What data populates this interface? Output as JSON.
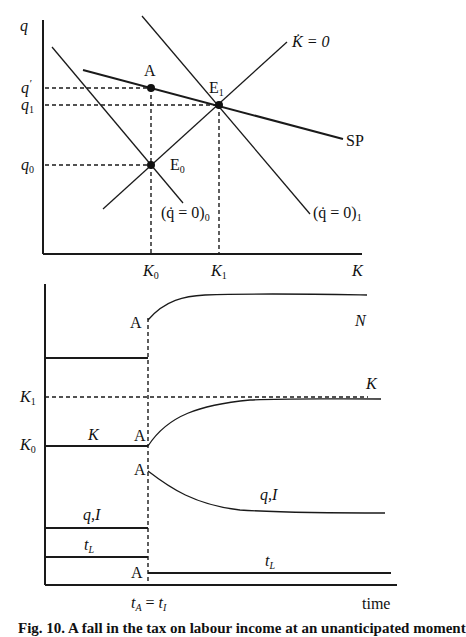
{
  "diagram": {
    "top_panel": {
      "axes": {
        "y_label": "q",
        "x_label": "K"
      },
      "y_ticks": [
        {
          "label": "q",
          "prime": "′",
          "name": "q-prime"
        },
        {
          "label": "q",
          "sub": "1",
          "name": "q1"
        },
        {
          "label": "q",
          "sub": "0",
          "name": "q0"
        }
      ],
      "x_ticks": [
        {
          "label": "K",
          "sub": "0"
        },
        {
          "label": "K",
          "sub": "1"
        }
      ],
      "points": {
        "A": "A",
        "E0": {
          "label": "E",
          "sub": "0"
        },
        "E1": {
          "label": "E",
          "sub": "1"
        }
      },
      "curves": {
        "k_dot_zero": "K̇ = 0",
        "sp": "SP",
        "q_dot_zero_0": {
          "label": "(q̇ = 0)",
          "sub": "0"
        },
        "q_dot_zero_1": {
          "label": "(q̇ = 0)",
          "sub": "1"
        }
      }
    },
    "bottom_panel": {
      "x_label": "time",
      "x_tick": {
        "label": "t",
        "sub_a": "A",
        "eq": " = ",
        "sub_i": "I",
        "label2": "t"
      },
      "y_ticks": [
        {
          "label": "K",
          "sub": "1"
        },
        {
          "label": "K",
          "sub": "0"
        }
      ],
      "series_labels": {
        "N": "N",
        "K_after": "K",
        "K_before": "K",
        "qI_before": "q,I",
        "qI_after": "q,I",
        "tL_before": "t",
        "tL_after": "t",
        "tL_sub": "L"
      },
      "jump_marker": "A"
    },
    "caption_partial": "Fig. 10. A fall in the tax on labour income at an unanticipated moment"
  }
}
